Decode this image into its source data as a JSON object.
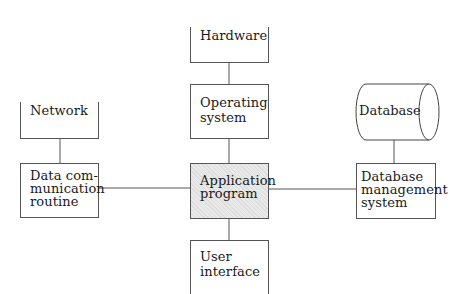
{
  "diagram": {
    "nodes": {
      "hardware": {
        "label": "Hardware"
      },
      "operating_system": {
        "label": "Operating\nsystem"
      },
      "network": {
        "label": "Network"
      },
      "data_comm": {
        "label": "Data com-\nmunication\nroutine"
      },
      "application": {
        "label": "Application\nprogram"
      },
      "database": {
        "label": "Database"
      },
      "dbms": {
        "label": "Database\nmanagement\nsystem"
      },
      "user_interface": {
        "label": "User\ninterface"
      }
    },
    "edges": [
      {
        "from": "hardware",
        "to": "operating_system"
      },
      {
        "from": "operating_system",
        "to": "application"
      },
      {
        "from": "network",
        "to": "data_comm"
      },
      {
        "from": "data_comm",
        "to": "application"
      },
      {
        "from": "application",
        "to": "dbms"
      },
      {
        "from": "database",
        "to": "dbms"
      },
      {
        "from": "application",
        "to": "user_interface"
      }
    ],
    "colors": {
      "line": "#555555",
      "highlight_fill": "#e9e9e9"
    }
  }
}
